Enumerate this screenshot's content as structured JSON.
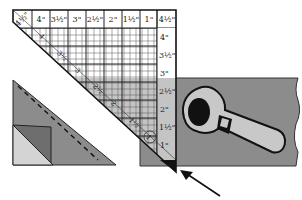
{
  "diagram": {
    "ruler": {
      "top_labels": [
        "4½\"",
        "4\"",
        "3½\"",
        "3\"",
        "2½\"",
        "2\"",
        "1½\"",
        "1\"",
        "4½\""
      ],
      "side_labels": [
        "4\"",
        "3½\"",
        "3\"",
        "2½\"",
        "2\"",
        "1½\"",
        "1\""
      ],
      "diagonal_labels": [
        "4",
        "3½",
        "3",
        "2½",
        "2",
        "1½",
        "1"
      ]
    },
    "colors": {
      "fabric": "#8c8c8c",
      "fabric_light": "#c8c8c8",
      "ruler_overlay": "#c4c4c4",
      "folded_corner": "#6e6e6e",
      "cutter_handle": "#c8c8c8",
      "line": "#1a1a1a"
    }
  }
}
